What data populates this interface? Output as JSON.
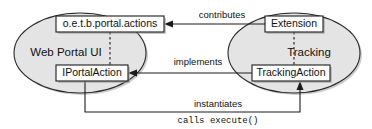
{
  "diagram": {
    "type": "uml-component-diagram",
    "title": "",
    "background_color": "#ffffff",
    "ellipse_fill": "#e4e4e4",
    "ellipse_stroke": "#2b2b2b",
    "box_fill": "#ffffff",
    "box_stroke": "#1c1c1c",
    "line_color": "#1c1c1c",
    "groups": [
      {
        "id": "web-portal-ui",
        "label": "Web Portal UI",
        "label_x": 66,
        "label_y": 53,
        "cx": 80,
        "cy": 53,
        "rx": 66,
        "ry": 40
      },
      {
        "id": "tracking",
        "label": "Tracking",
        "label_x": 309,
        "label_y": 53,
        "cx": 294,
        "cy": 53,
        "rx": 66,
        "ry": 40
      }
    ],
    "nodes": [
      {
        "id": "portal-actions",
        "label": "o.e.t.b.portal.actions",
        "x": 56,
        "y": 16,
        "width": 108,
        "height": 16,
        "group": "web-portal-ui"
      },
      {
        "id": "iportalaction",
        "label": "IPortalAction",
        "x": 56,
        "y": 65,
        "width": 72,
        "height": 16,
        "group": "web-portal-ui"
      },
      {
        "id": "extension",
        "label": "Extension",
        "x": 265,
        "y": 16,
        "width": 58,
        "height": 16,
        "group": "tracking"
      },
      {
        "id": "trackingaction",
        "label": "TrackingAction",
        "x": 252,
        "y": 65,
        "width": 78,
        "height": 16,
        "group": "tracking"
      }
    ],
    "edges": [
      {
        "id": "contributes",
        "label": "contributes",
        "from": "extension",
        "to": "portal-actions",
        "label_x": 222,
        "label_y": 15,
        "style": "solid",
        "arrow": "open-left"
      },
      {
        "id": "implements",
        "label": "implements",
        "from": "trackingaction",
        "to": "iportalaction",
        "label_x": 198,
        "label_y": 62,
        "style": "solid",
        "arrow": "open-left"
      },
      {
        "id": "instantiates",
        "label": "instantiates",
        "from": "iportalaction",
        "to": "trackingaction",
        "label_x": 218,
        "label_y": 104,
        "style": "solid",
        "arrow": "open-up"
      },
      {
        "id": "calls-execute",
        "label": "calls execute()",
        "from": "iportalaction",
        "to": "trackingaction",
        "label_x": 218,
        "label_y": 120,
        "style": "solid",
        "arrow": "none",
        "mono": true
      }
    ],
    "dependencies": [
      {
        "id": "portal-internal-dependency",
        "from": "portal-actions",
        "to": "iportalaction",
        "style": "dashed"
      },
      {
        "id": "tracking-internal-dependency",
        "from": "extension",
        "to": "trackingaction",
        "style": "dashed"
      }
    ]
  }
}
